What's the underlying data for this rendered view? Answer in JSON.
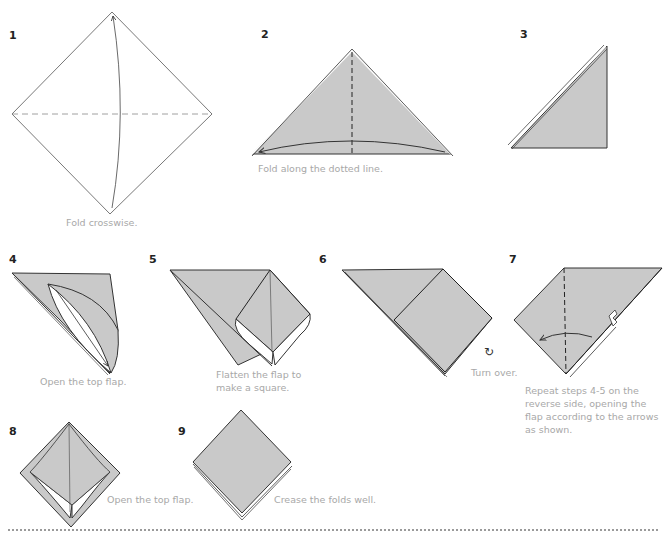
{
  "diagram": {
    "type": "origami-instructions",
    "colors": {
      "paper": "#c9c9c9",
      "outline": "#333333",
      "caption": "#a8a8a8"
    },
    "steps": [
      {
        "number": "1",
        "caption": "Fold crosswise."
      },
      {
        "number": "2",
        "caption": "Fold along the dotted line."
      },
      {
        "number": "3",
        "caption": ""
      },
      {
        "number": "4",
        "caption": "Open the top flap."
      },
      {
        "number": "5",
        "caption": "Flatten the flap to make a square."
      },
      {
        "number": "6",
        "caption": "Turn over."
      },
      {
        "number": "7",
        "caption": "Repeat steps 4-5 on the reverse side, opening the flap according to the arrows as shown."
      },
      {
        "number": "8",
        "caption": "Open the top flap."
      },
      {
        "number": "9",
        "caption": "Crease the folds well."
      }
    ]
  }
}
